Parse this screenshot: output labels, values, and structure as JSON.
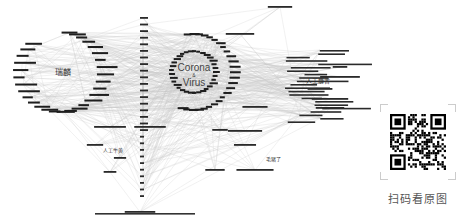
{
  "diagram": {
    "type": "network-graph",
    "edge_color": "#b8b8b8",
    "node_text_color": "#222222",
    "clusters": [
      {
        "id": "left",
        "label": "瑞麟",
        "cx": 63,
        "cy": 72,
        "r": 42
      },
      {
        "id": "center",
        "label_line1": "Corona",
        "label_line2": "Virus",
        "cx": 194,
        "cy": 72,
        "r": 22
      },
      {
        "id": "right",
        "label": "人工麝香",
        "cx": 330,
        "cy": 82
      },
      {
        "id": "lower-left",
        "label": "人工牛黄",
        "cx": 113,
        "cy": 150
      },
      {
        "id": "lower-mid",
        "label": "毛猪了",
        "cx": 270,
        "cy": 158
      }
    ],
    "nodes": [
      {
        "label": "",
        "x": 120,
        "y": 158
      },
      {
        "label": "",
        "x": 245,
        "y": 145
      },
      {
        "label": "",
        "x": 240,
        "y": 34
      },
      {
        "label": "",
        "x": 280,
        "y": 7
      },
      {
        "label": "",
        "x": 340,
        "y": 67
      },
      {
        "label": "",
        "x": 340,
        "y": 77
      },
      {
        "label": "",
        "x": 320,
        "y": 89
      },
      {
        "label": "",
        "x": 330,
        "y": 99
      },
      {
        "label": "",
        "x": 330,
        "y": 108
      },
      {
        "label": "",
        "x": 255,
        "y": 107
      },
      {
        "label": "",
        "x": 220,
        "y": 130
      },
      {
        "label": "",
        "x": 245,
        "y": 131
      },
      {
        "label": "",
        "x": 255,
        "y": 170
      },
      {
        "label": "",
        "x": 215,
        "y": 170
      },
      {
        "label": "",
        "x": 110,
        "y": 172
      },
      {
        "label": "",
        "x": 95,
        "y": 145
      },
      {
        "label": "",
        "x": 110,
        "y": 127
      },
      {
        "label": "",
        "x": 150,
        "y": 127
      },
      {
        "label": "",
        "x": 140,
        "y": 212
      }
    ],
    "column_ticks": [
      "",
      "",
      "",
      "",
      "",
      "",
      "",
      "",
      "",
      "",
      "",
      "",
      "",
      ""
    ]
  },
  "qr": {
    "caption": "扫码看原图"
  }
}
